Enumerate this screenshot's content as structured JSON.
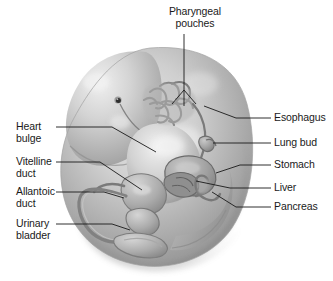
{
  "figure": {
    "background_color": "#ffffff",
    "line_color": "#1a1a1a",
    "body_fill_light": "#d8d8d8",
    "body_fill_mid": "#b4b4b4",
    "body_fill_dark": "#8a8a8a",
    "organ_fill": "#9c9c9c"
  },
  "labels": {
    "pharyngeal_pouches": "Pharyngeal\npouches",
    "esophagus": "Esophagus",
    "lung_bud": "Lung bud",
    "stomach": "Stomach",
    "liver": "Liver",
    "pancreas": "Pancreas",
    "heart_bulge": "Heart\nbulge",
    "vitelline_duct": "Vitelline\nduct",
    "allantoic_duct": "Allantoic\nduct",
    "urinary_bladder": "Urinary\nbladder"
  },
  "callouts": [
    {
      "id": "pharyngeal-pouches",
      "label": "Pharyngeal pouches",
      "side": "top",
      "text_x": 214,
      "text_y": 10
    },
    {
      "id": "esophagus",
      "label": "Esophagus",
      "side": "right",
      "text_x": 273,
      "text_y": 113
    },
    {
      "id": "lung-bud",
      "label": "Lung bud",
      "side": "right",
      "text_x": 273,
      "text_y": 138
    },
    {
      "id": "stomach",
      "label": "Stomach",
      "side": "right",
      "text_x": 273,
      "text_y": 160
    },
    {
      "id": "liver",
      "label": "Liver",
      "side": "right",
      "text_x": 273,
      "text_y": 183
    },
    {
      "id": "pancreas",
      "label": "Pancreas",
      "side": "right",
      "text_x": 273,
      "text_y": 202
    },
    {
      "id": "heart-bulge",
      "label": "Heart bulge",
      "side": "left",
      "text_x": 16,
      "text_y": 122
    },
    {
      "id": "vitelline-duct",
      "label": "Vitelline duct",
      "side": "left",
      "text_x": 16,
      "text_y": 157
    },
    {
      "id": "allantoic-duct",
      "label": "Allantoic duct",
      "side": "left",
      "text_x": 16,
      "text_y": 187
    },
    {
      "id": "urinary-bladder",
      "label": "Urinary bladder",
      "side": "left",
      "text_x": 16,
      "text_y": 219
    }
  ],
  "anatomy": {
    "parts": [
      "head",
      "heart-bulge",
      "pharyngeal-arches",
      "esophagus",
      "lung-bud",
      "stomach",
      "liver",
      "pancreas",
      "vitelline-duct",
      "allantoic-duct",
      "urinary-bladder",
      "tail"
    ],
    "eye_spot": {
      "x": 118,
      "y": 100
    }
  }
}
